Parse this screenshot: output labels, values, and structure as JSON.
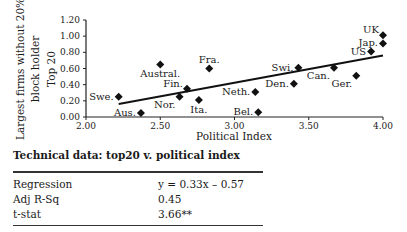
{
  "chart_data": {
    "type": "scatter",
    "title": "",
    "xlabel": "Political Index",
    "ylabel": "Largest firms without 20% block holder Top 20",
    "ylabel_lines": [
      "Largest firms without 20%",
      "block holder",
      "Top 20"
    ],
    "xlim": [
      2.0,
      4.0
    ],
    "ylim": [
      0.0,
      1.2
    ],
    "x_ticks": [
      2.0,
      2.5,
      3.0,
      3.5,
      4.0
    ],
    "x_tick_labels": [
      "2.00",
      "2.50",
      "3.00",
      "3.50",
      "4.00"
    ],
    "y_ticks": [
      0.0,
      0.2,
      0.4,
      0.6,
      0.8,
      1.0,
      1.2
    ],
    "y_tick_labels": [
      "0.00",
      "0.20",
      "0.40",
      "0.60",
      "0.80",
      "1.00",
      "1.20"
    ],
    "grid": false,
    "legend": null,
    "marker": "diamond",
    "points": [
      {
        "label": "Swe.",
        "x": 2.22,
        "y": 0.25,
        "label_pos": "left"
      },
      {
        "label": "Aus.",
        "x": 2.37,
        "y": 0.05,
        "label_pos": "left"
      },
      {
        "label": "Austral.",
        "x": 2.5,
        "y": 0.65,
        "label_pos": "below"
      },
      {
        "label": "Nor.",
        "x": 2.63,
        "y": 0.25,
        "label_pos": "below-left"
      },
      {
        "label": "Fin.",
        "x": 2.68,
        "y": 0.35,
        "label_pos": "above-left"
      },
      {
        "label": "Ita.",
        "x": 2.76,
        "y": 0.21,
        "label_pos": "below"
      },
      {
        "label": "Fra.",
        "x": 2.83,
        "y": 0.6,
        "label_pos": "above"
      },
      {
        "label": "Neth.",
        "x": 3.14,
        "y": 0.31,
        "label_pos": "left"
      },
      {
        "label": "Bel.",
        "x": 3.16,
        "y": 0.06,
        "label_pos": "left"
      },
      {
        "label": "Den.",
        "x": 3.4,
        "y": 0.41,
        "label_pos": "left"
      },
      {
        "label": "Swi.",
        "x": 3.43,
        "y": 0.61,
        "label_pos": "left"
      },
      {
        "label": "Can.",
        "x": 3.67,
        "y": 0.61,
        "label_pos": "below-left"
      },
      {
        "label": "Ger.",
        "x": 3.82,
        "y": 0.51,
        "label_pos": "below-left"
      },
      {
        "label": "US",
        "x": 3.92,
        "y": 0.81,
        "label_pos": "left"
      },
      {
        "label": "Jap.",
        "x": 4.0,
        "y": 0.91,
        "label_pos": "left"
      },
      {
        "label": "UK",
        "x": 4.0,
        "y": 1.01,
        "label_pos": "above-left"
      }
    ],
    "trendline": {
      "x": [
        2.22,
        4.0
      ],
      "y": [
        0.16,
        0.76
      ],
      "equation": "y = 0.33x - 0.57"
    }
  },
  "table": {
    "title": "Technical data: top20 v. political index",
    "rows": [
      {
        "label": "Regression",
        "value": "y = 0.33x – 0.57"
      },
      {
        "label": "Adj R-Sq",
        "value": "0.45"
      },
      {
        "label": "t-stat",
        "value": "3.66**"
      }
    ]
  }
}
